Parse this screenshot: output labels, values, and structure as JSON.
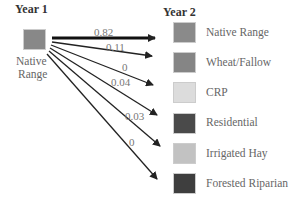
{
  "source": {
    "header": "Year 1",
    "label_line1": "Native",
    "label_line2": "Range",
    "color": "#888888"
  },
  "target": {
    "header": "Year 2",
    "items": [
      {
        "label": "Native Range",
        "color": "#8a8a8a"
      },
      {
        "label": "Wheat/Fallow",
        "color": "#858585"
      },
      {
        "label": "CRP",
        "color": "#dcdcdc"
      },
      {
        "label": "Residential",
        "color": "#4a4a4a"
      },
      {
        "label": "Irrigated Hay",
        "color": "#c2c2c2"
      },
      {
        "label": "Forested Riparian",
        "color": "#3e3e3e"
      }
    ]
  },
  "transitions": [
    {
      "to": "Native Range",
      "value": "0.82"
    },
    {
      "to": "Wheat/Fallow",
      "value": "0.11"
    },
    {
      "to": "CRP",
      "value": "0"
    },
    {
      "to": "Residential",
      "value": "0.04"
    },
    {
      "to": "Irrigated Hay",
      "value": "0.03"
    },
    {
      "to": "Forested Riparian",
      "value": "0"
    }
  ]
}
